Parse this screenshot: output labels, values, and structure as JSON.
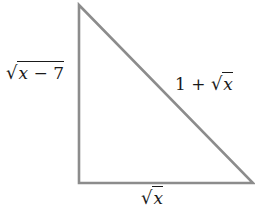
{
  "diagram": {
    "type": "right-triangle",
    "stroke_color": "#8c8c8c",
    "vertices": {
      "top": [
        79,
        5
      ],
      "bottom_left": [
        79,
        183
      ],
      "bottom_right": [
        253,
        183
      ]
    },
    "labels": {
      "vertical_leg": {
        "prefix": "",
        "radicand_var": "x",
        "radicand_rest": " − 7"
      },
      "hypotenuse": {
        "prefix": "1 + ",
        "radicand_var": "x",
        "radicand_rest": ""
      },
      "horizontal_leg": {
        "prefix": "",
        "radicand_var": "x",
        "radicand_rest": ""
      }
    }
  }
}
